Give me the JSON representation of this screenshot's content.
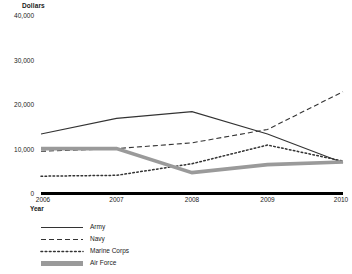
{
  "chart_data": {
    "type": "line",
    "title": "",
    "xlabel": "Year",
    "ylabel": "Dollars",
    "categories": [
      "2006",
      "2007",
      "2008",
      "2009",
      "2010"
    ],
    "x": [
      2006,
      2007,
      2008,
      2009,
      2010
    ],
    "ylim": [
      0,
      40000
    ],
    "yticks": [
      0,
      10000,
      20000,
      30000,
      40000
    ],
    "ytick_labels": [
      "0",
      "10,000",
      "20,000",
      "30,000",
      "40,000"
    ],
    "grid": false,
    "legend_position": "below-left",
    "series": [
      {
        "name": "Army",
        "style": "solid",
        "color": "#333333",
        "values": [
          13500,
          17000,
          18500,
          13500,
          7000
        ]
      },
      {
        "name": "Navy",
        "style": "dashed",
        "color": "#333333",
        "values": [
          9600,
          10200,
          11500,
          14500,
          23000
        ]
      },
      {
        "name": "Marine Corps",
        "style": "dotted",
        "color": "#333333",
        "values": [
          4000,
          4200,
          6800,
          11000,
          7400
        ]
      },
      {
        "name": "Air Force",
        "style": "thick",
        "color": "#9a9a9a",
        "values": [
          10200,
          10200,
          4800,
          6600,
          7200
        ]
      }
    ]
  },
  "axis": {
    "y_title": "Dollars",
    "x_title": "Year"
  },
  "legend": {
    "items": [
      {
        "label": "Army",
        "icon": "solid-line-swatch"
      },
      {
        "label": "Navy",
        "icon": "dashed-line-swatch"
      },
      {
        "label": "Marine Corps",
        "icon": "dotted-line-swatch"
      },
      {
        "label": "Air Force",
        "icon": "thick-gray-line-swatch"
      }
    ]
  }
}
